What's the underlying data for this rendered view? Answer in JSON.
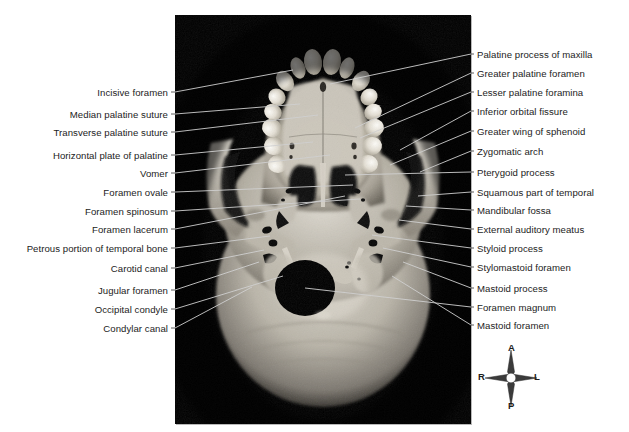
{
  "figure": {
    "panel_background": "#000000",
    "page_background": "#ffffff",
    "leader_line_color_outside": "#4a4a4a",
    "leader_line_color_inside": "#cfcfcf"
  },
  "labels_left": [
    {
      "text": "Incisive foramen",
      "label_y": 92,
      "tip_x": 293,
      "tip_y": 70
    },
    {
      "text": "Median palatine suture",
      "label_y": 114,
      "tip_x": 300,
      "tip_y": 104
    },
    {
      "text": "Transverse palatine suture",
      "label_y": 132,
      "tip_x": 318,
      "tip_y": 115
    },
    {
      "text": "Horizontal plate of palatine",
      "label_y": 155,
      "tip_x": 313,
      "tip_y": 142
    },
    {
      "text": "Vomer",
      "label_y": 173,
      "tip_x": 330,
      "tip_y": 155
    },
    {
      "text": "Foramen ovale",
      "label_y": 192,
      "tip_x": 353,
      "tip_y": 185
    },
    {
      "text": "Foramen spinosum",
      "label_y": 211,
      "tip_x": 360,
      "tip_y": 199
    },
    {
      "text": "Foramen lacerum",
      "label_y": 229,
      "tip_x": 345,
      "tip_y": 196
    },
    {
      "text": "Petrous portion of temporal bone",
      "label_y": 248,
      "tip_x": 270,
      "tip_y": 236
    },
    {
      "text": "Carotid canal",
      "label_y": 268,
      "tip_x": 264,
      "tip_y": 250
    },
    {
      "text": "Jugular foramen",
      "label_y": 290,
      "tip_x": 259,
      "tip_y": 262
    },
    {
      "text": "Occipital condyle",
      "label_y": 309,
      "tip_x": 283,
      "tip_y": 276
    },
    {
      "text": "Condylar canal",
      "label_y": 328,
      "tip_x": 252,
      "tip_y": 287
    }
  ],
  "labels_right": [
    {
      "text": "Palatine process of maxilla",
      "label_y": 54,
      "tip_x": 330,
      "tip_y": 84
    },
    {
      "text": "Greater palatine foramen",
      "label_y": 73,
      "tip_x": 355,
      "tip_y": 128
    },
    {
      "text": "Lesser palatine foramina",
      "label_y": 92,
      "tip_x": 360,
      "tip_y": 138
    },
    {
      "text": "Inferior orbital fissure",
      "label_y": 111,
      "tip_x": 400,
      "tip_y": 150
    },
    {
      "text": "Greater wing of sphenoid",
      "label_y": 131,
      "tip_x": 390,
      "tip_y": 165
    },
    {
      "text": "Zygomatic arch",
      "label_y": 151,
      "tip_x": 420,
      "tip_y": 172
    },
    {
      "text": "Pterygoid process",
      "label_y": 172,
      "tip_x": 345,
      "tip_y": 175
    },
    {
      "text": "Squamous part of temporal",
      "label_y": 192,
      "tip_x": 418,
      "tip_y": 196
    },
    {
      "text": "Mandibular fossa",
      "label_y": 210,
      "tip_x": 406,
      "tip_y": 206
    },
    {
      "text": "External auditory meatus",
      "label_y": 229,
      "tip_x": 399,
      "tip_y": 220
    },
    {
      "text": "Styloid process",
      "label_y": 248,
      "tip_x": 372,
      "tip_y": 235
    },
    {
      "text": "Stylomastoid foramen",
      "label_y": 267,
      "tip_x": 383,
      "tip_y": 248
    },
    {
      "text": "Mastoid process",
      "label_y": 288,
      "tip_x": 403,
      "tip_y": 262
    },
    {
      "text": "Foramen magnum",
      "label_y": 307,
      "tip_x": 305,
      "tip_y": 288
    },
    {
      "text": "Mastoid foramen",
      "label_y": 325,
      "tip_x": 392,
      "tip_y": 276
    }
  ],
  "compass": {
    "anterior": "A",
    "posterior": "P",
    "right": "R",
    "left": "L"
  }
}
